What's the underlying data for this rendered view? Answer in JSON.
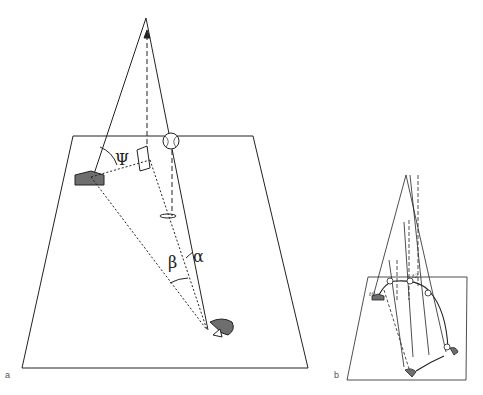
{
  "figure": {
    "panels": [
      {
        "id": "a",
        "label": "a",
        "angle_labels": {
          "psi": "Ψ",
          "beta": "β",
          "alpha": "α"
        },
        "elements": [
          "ground-plane",
          "home-plate",
          "ball",
          "ball-shadow",
          "fielder",
          "optical-projection-plane"
        ]
      },
      {
        "id": "b",
        "label": "b",
        "time_labels": [
          "t0",
          "t1",
          "t2",
          "t3",
          "t4",
          "t5"
        ],
        "elements": [
          "ground-plane",
          "ball-trajectory",
          "fielder-path",
          "projection-rays"
        ]
      }
    ],
    "colors": {
      "line": "#222222",
      "fill_gray": "#6e6e6e",
      "background": "#ffffff"
    }
  }
}
